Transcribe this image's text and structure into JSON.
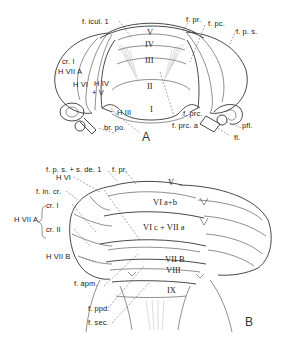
{
  "figure": {
    "panels": [
      {
        "id": "A",
        "label": "A",
        "view": "cerebellum, anterior view",
        "lobules": [
          "V",
          "IV",
          "III",
          "II",
          "I"
        ],
        "labels": {
          "f_icul_1": "f. icul. 1",
          "f_pr": "f. pr.",
          "f_pc": "f. pc.",
          "f_ps": "f. p. s.",
          "cr_I": "cr. I",
          "H_VIIA": "H VII A",
          "H_VI": "H VI",
          "H_IV": "H IV",
          "plus_V": "+ V",
          "H_III": "H III",
          "br_po": "br. po.",
          "f_prc": "f. prc.",
          "f_prc_a": "f. prc. a",
          "pfl": "pfl.",
          "fl": "fl."
        }
      },
      {
        "id": "B",
        "label": "B",
        "view": "cerebellum, posterior view",
        "lobules": [
          "V",
          "VI a+b",
          "VI c + VII a",
          "VII B",
          "VIII",
          "IX"
        ],
        "labels": {
          "f_ps_sde1": "f. p. s. + s. de. 1",
          "f_pr": "f. pr.",
          "H_VI": "H VI",
          "f_in_cr": "f. in. cr.",
          "H_VIIA": "H VII A",
          "cr_I": "cr. I",
          "cr_II": "cr. II",
          "H_VIIB": "H VII B",
          "f_apm": "f. apm.",
          "f_ppd": "f. ppd.",
          "f_sec": "f. sec."
        }
      }
    ]
  }
}
